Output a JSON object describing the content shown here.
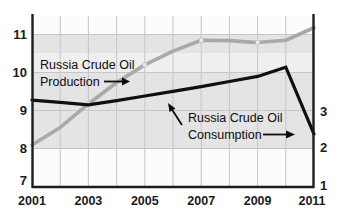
{
  "chart_data": {
    "type": "line",
    "title": "",
    "xlabel": "",
    "ylabel": "",
    "grid": true,
    "legend_position": "inline-annotations",
    "x": [
      2001,
      2002,
      2003,
      2004,
      2005,
      2006,
      2007,
      2008,
      2009,
      2010,
      2011
    ],
    "x_tick_labels": [
      "2001",
      "2003",
      "2005",
      "2007",
      "2009",
      "2011"
    ],
    "x_tick_values": [
      2001,
      2003,
      2005,
      2007,
      2009,
      2011
    ],
    "left_axis": {
      "tick_labels": [
        "11",
        "10",
        "9",
        "8",
        "7"
      ],
      "tick_values": [
        11,
        10,
        9,
        8,
        7
      ],
      "ylim": [
        7,
        11.4
      ]
    },
    "right_axis": {
      "tick_labels": [
        "3",
        "2",
        "1"
      ],
      "tick_values": [
        3,
        2,
        1
      ],
      "ylim": [
        0.9,
        4.6
      ]
    },
    "series": [
      {
        "name": "Russia Crude Oil Production",
        "axis": "left",
        "color": "#a9a9a9",
        "marker": "square-light",
        "values": [
          8.1,
          8.55,
          9.15,
          9.7,
          10.15,
          10.5,
          10.78,
          10.77,
          10.72,
          10.78,
          11.1
        ]
      },
      {
        "name": "Russia Crude Oil Consumption",
        "axis": "right",
        "color": "#101010",
        "marker": "none",
        "values": [
          2.79,
          2.74,
          2.69,
          2.78,
          2.88,
          2.98,
          3.08,
          3.19,
          3.3,
          3.5,
          2.06
        ]
      }
    ],
    "annotations": [
      {
        "id": "production-label",
        "text_line1": "Russia Crude Oil",
        "text_line2": "Production",
        "arrow": "right"
      },
      {
        "id": "consumption-label",
        "text_line1": "Russia Crude Oil",
        "text_line2": "Consumption",
        "arrow": "right-and-upleft"
      }
    ],
    "colors": {
      "production_line": "#a9a9a9",
      "consumption_line": "#101010",
      "band": "#e3e3e3",
      "plot_background": "#fbfbfb",
      "gridline": "#c6c6cf",
      "axis": "#1c1c1c",
      "text": "#111111"
    }
  }
}
